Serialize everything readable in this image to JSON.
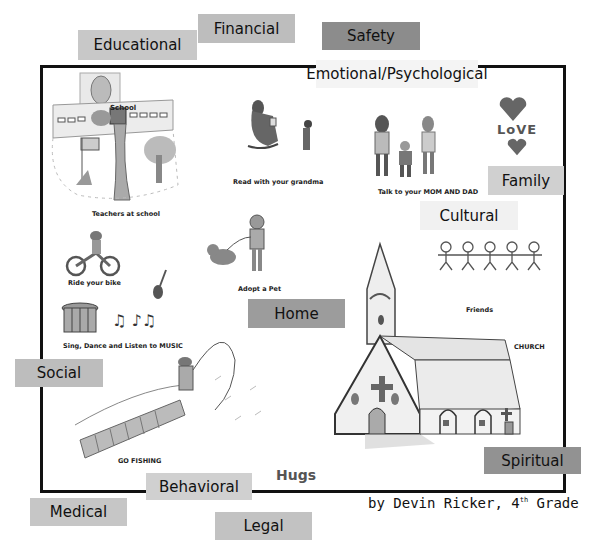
{
  "title_frame": "child drawing collage",
  "categories": [
    {
      "id": "educational",
      "label": "Educational",
      "x": 78,
      "y": 30,
      "w": 119,
      "h": 30,
      "bg": "#c8c8c8"
    },
    {
      "id": "financial",
      "label": "Financial",
      "x": 198,
      "y": 14,
      "w": 97,
      "h": 29,
      "bg": "#bdbdbd"
    },
    {
      "id": "safety",
      "label": "Safety",
      "x": 322,
      "y": 22,
      "w": 98,
      "h": 28,
      "bg": "#8c8c8c"
    },
    {
      "id": "emotional",
      "label": "Emotional/Psychological",
      "x": 316,
      "y": 60,
      "w": 162,
      "h": 28,
      "bg": "#f4f4f4"
    },
    {
      "id": "family",
      "label": "Family",
      "x": 488,
      "y": 166,
      "w": 76,
      "h": 29,
      "bg": "#d0d0d0"
    },
    {
      "id": "cultural",
      "label": "Cultural",
      "x": 420,
      "y": 201,
      "w": 98,
      "h": 29,
      "bg": "#f1f1f1"
    },
    {
      "id": "home",
      "label": "Home",
      "x": 248,
      "y": 299,
      "w": 97,
      "h": 29,
      "bg": "#9c9c9c"
    },
    {
      "id": "social",
      "label": "Social",
      "x": 15,
      "y": 359,
      "w": 88,
      "h": 28,
      "bg": "#bdbdbd"
    },
    {
      "id": "spiritual",
      "label": "Spiritual",
      "x": 484,
      "y": 447,
      "w": 97,
      "h": 27,
      "bg": "#929292"
    },
    {
      "id": "behavioral",
      "label": "Behavioral",
      "x": 146,
      "y": 473,
      "w": 106,
      "h": 27,
      "bg": "#d0d0d0"
    },
    {
      "id": "medical",
      "label": "Medical",
      "x": 30,
      "y": 498,
      "w": 97,
      "h": 28,
      "bg": "#c6c6c6"
    },
    {
      "id": "legal",
      "label": "Legal",
      "x": 215,
      "y": 512,
      "w": 97,
      "h": 28,
      "bg": "#c2c2c2"
    }
  ],
  "captions": {
    "school_sign": "School",
    "teachers": "Teachers at school",
    "grandma": "Read with your grandma",
    "parents": "Talk to your MOM AND DAD",
    "love": "LoVE",
    "bike": "Ride your bike",
    "pet": "Adopt a Pet",
    "music": "Sing, Dance and Listen to MUSIC",
    "friends": "Friends",
    "church": "CHURCH",
    "fishing": "GO FISHING",
    "hugs": "Hugs"
  },
  "credit": {
    "prefix": "by Devin Ricker, 4",
    "sup": "th",
    "suffix": " Grade"
  }
}
